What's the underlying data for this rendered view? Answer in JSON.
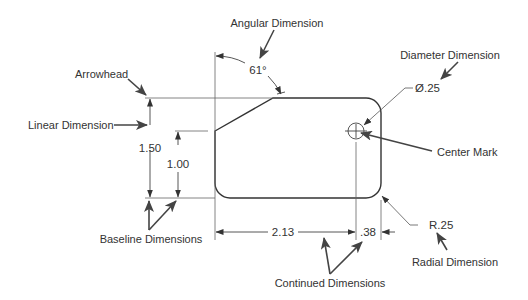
{
  "labels": {
    "angular": "Angular Dimension",
    "arrowhead": "Arrowhead",
    "linear": "Linear Dimension",
    "diameter": "Diameter Dimension",
    "center_mark": "Center Mark",
    "baseline": "Baseline Dimensions",
    "continued": "Continued Dimensions",
    "radial": "Radial Dimension"
  },
  "dimensions": {
    "angle": "61°",
    "diameter": "Ø.25",
    "height_total": "1.50",
    "height_partial": "1.00",
    "width_main": "2.13",
    "width_offset": ".38",
    "radius": "R.25"
  },
  "colors": {
    "part_outline": "#333333",
    "thin_line": "#555555",
    "pointer_arrow": "#444444"
  }
}
